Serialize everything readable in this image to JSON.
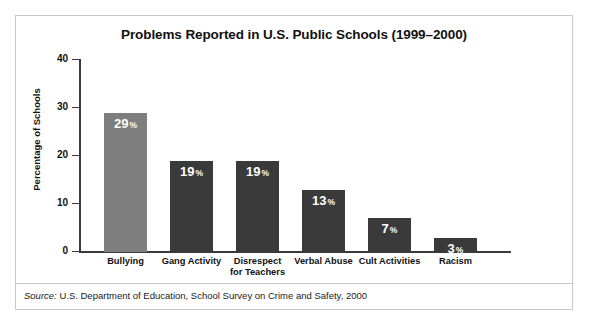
{
  "figure": {
    "title": "Problems Reported in U.S. Public Schools (1999–2000)",
    "source_label": "Source:",
    "source_text": " U.S. Department of Education, School Survey on Crime and Safety, 2000",
    "border_color": "#c9c9c9"
  },
  "chart_data": {
    "type": "bar",
    "title": "Problems Reported in U.S. Public Schools (1999–2000)",
    "xlabel": "",
    "ylabel": "Percentage of Schools",
    "ylim": [
      0,
      40
    ],
    "yticks": [
      "0",
      "10",
      "20",
      "30",
      "40"
    ],
    "grid": false,
    "legend": "none",
    "value_suffix": "%",
    "categories": [
      "Bullying",
      "Gang Activity",
      "Disrespect for Teachers",
      "Verbal Abuse",
      "Cult Activities",
      "Racism"
    ],
    "category_lines": [
      [
        "Bullying"
      ],
      [
        "Gang Activity"
      ],
      [
        "Disrespect",
        "for Teachers"
      ],
      [
        "Verbal Abuse"
      ],
      [
        "Cult Activities"
      ],
      [
        "Racism"
      ]
    ],
    "values": [
      29,
      19,
      19,
      13,
      7,
      3
    ],
    "value_labels": [
      "29",
      "19",
      "19",
      "13",
      "7",
      "3"
    ],
    "bar_colors": [
      "#7e7e7e",
      "#3a3a3a",
      "#3a3a3a",
      "#3a3a3a",
      "#3a3a3a",
      "#3a3a3a"
    ]
  }
}
